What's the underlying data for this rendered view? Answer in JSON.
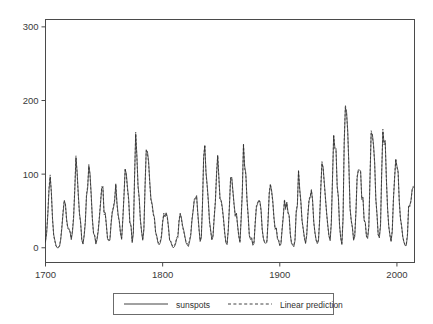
{
  "chart_data": {
    "type": "line",
    "title": "",
    "subtitle": "",
    "xlabel": "",
    "ylabel": "",
    "xlim": [
      1700,
      2015
    ],
    "ylim": [
      -20,
      310
    ],
    "grid": false,
    "legend_position": "bottom",
    "x_ticks": [
      1700,
      1800,
      1900,
      2000
    ],
    "x_tick_labels": [
      "1700",
      "1800",
      "1900",
      "2000"
    ],
    "y_ticks": [
      0,
      100,
      200,
      300
    ],
    "y_tick_labels": [
      "0",
      "100",
      "200",
      "300"
    ],
    "x_start": 1700,
    "x_step": 1,
    "series": [
      {
        "name": "sunspots",
        "style": "solid",
        "values": [
          8,
          20,
          45,
          78,
          96,
          76,
          40,
          18,
          10,
          3,
          0,
          0,
          2,
          11,
          27,
          47,
          63,
          60,
          39,
          28,
          26,
          22,
          11,
          21,
          40,
          78,
          122,
          103,
          73,
          47,
          35,
          11,
          5,
          16,
          34,
          70,
          81,
          111,
          101,
          73,
          40,
          20,
          16,
          5,
          11,
          22,
          40,
          60,
          80.9,
          83.4,
          47.7,
          47.8,
          30.7,
          12.2,
          9.6,
          10.2,
          32.4,
          47.6,
          54,
          62.9,
          85.9,
          61.2,
          45.1,
          36.4,
          20.9,
          11.4,
          37.8,
          69.8,
          106.1,
          100.8,
          81.6,
          66.5,
          34.8,
          30.6,
          7,
          19.8,
          92.5,
          154.4,
          125.9,
          84.8,
          68.1,
          38.5,
          22.8,
          10.2,
          24.1,
          82.9,
          132,
          130.9,
          118.1,
          89.9,
          66.6,
          60,
          46.9,
          41,
          21.3,
          16,
          6.4,
          4.1,
          6.8,
          14.5,
          34,
          45,
          43.1,
          47.5,
          42.2,
          28.1,
          10.1,
          8.1,
          2.5,
          0,
          1.4,
          5,
          12.2,
          13.9,
          35.4,
          45.8,
          41.1,
          30.1,
          23.9,
          15.6,
          6.6,
          4,
          1.8,
          8.5,
          16.6,
          36.3,
          49.6,
          64.2,
          67,
          70.9,
          47.8,
          27.5,
          8.5,
          13.2,
          56.9,
          121.5,
          138.3,
          103.2,
          85.7,
          64.6,
          36.7,
          24.2,
          10.7,
          15,
          40.1,
          61.5,
          98.5,
          124.7,
          96.3,
          66.6,
          64.5,
          54.1,
          39,
          20.6,
          6.7,
          4.3,
          22.7,
          54.8,
          93.8,
          95.8,
          77.2,
          59.1,
          44,
          47,
          30.5,
          16.3,
          7.3,
          37.6,
          74,
          139,
          111.2,
          101.6,
          66.2,
          44.7,
          17,
          11.3,
          12.4,
          3.4,
          6,
          32.3,
          54.3,
          59.7,
          63.7,
          63.5,
          52.2,
          25.4,
          13.1,
          6.8,
          6.3,
          7.1,
          35.6,
          73,
          85.1,
          78,
          64,
          41.8,
          26.2,
          26.7,
          12.1,
          9.5,
          2.7,
          5,
          24.4,
          42,
          63.5,
          53.8,
          62,
          48.5,
          43.9,
          18.6,
          5.7,
          3.6,
          1.4,
          9.6,
          47.4,
          57.1,
          103.9,
          80.6,
          63.6,
          37.6,
          26.1,
          14.2,
          5.8,
          16.7,
          44.3,
          63.9,
          69,
          77.8,
          64.9,
          35.7,
          21.2,
          11.1,
          5.7,
          8.7,
          36.1,
          79.7,
          114.4,
          109.6,
          88.8,
          67.8,
          47.5,
          30.6,
          16.3,
          9.6,
          33.2,
          92.6,
          151.6,
          136.3,
          134.7,
          83.9,
          69.4,
          31.5,
          13.9,
          4.4,
          38,
          141.7,
          190.2,
          184.8,
          159,
          112.3,
          53.9,
          37.5,
          27.9,
          10.2,
          15.1,
          47,
          93.8,
          105.9,
          105.5,
          104.5,
          66.6,
          68.9,
          38,
          34.5,
          15.5,
          12.6,
          27.5,
          92.5,
          155.4,
          154.6,
          140.4,
          115.9,
          66.6,
          45.9,
          17.9,
          13.4,
          29.4,
          100.2,
          157.6,
          142.6,
          145.7,
          94.3,
          54.6,
          29.9,
          17.5,
          8.6,
          21.5,
          64.3,
          93.3,
          119.6,
          111,
          104,
          63.7,
          40.4,
          29.8,
          15.2,
          7.5,
          2.9,
          3.1,
          16.5,
          55.3,
          57.9,
          64.4,
          79.5,
          81.9
        ]
      },
      {
        "name": "Linear prediction",
        "style": "dashed",
        "values": [
          10,
          22,
          48,
          82,
          99,
          74,
          38,
          16,
          9,
          2,
          1,
          1,
          3,
          13,
          30,
          50,
          65,
          58,
          37,
          26,
          25,
          21,
          13,
          24,
          44,
          82,
          125,
          100,
          70,
          45,
          33,
          10,
          6,
          18,
          37,
          73,
          84,
          113,
          98,
          70,
          38,
          19,
          17,
          7,
          13,
          25,
          43,
          63,
          83,
          81,
          45,
          46,
          29,
          11,
          11,
          12,
          35,
          50,
          56,
          65,
          87,
          59,
          43,
          35,
          19,
          13,
          40,
          72,
          108,
          98,
          79,
          64,
          33,
          29,
          9,
          22,
          96,
          157,
          123,
          82,
          66,
          37,
          21,
          12,
          27,
          86,
          134,
          128,
          115,
          87,
          64,
          58,
          45,
          39,
          20,
          15,
          8,
          6,
          9,
          17,
          36,
          47,
          42,
          46,
          40,
          26,
          9,
          9,
          4,
          2,
          3,
          7,
          14,
          16,
          38,
          47,
          39,
          28,
          22,
          14,
          8,
          6,
          4,
          11,
          19,
          39,
          51,
          66,
          68,
          69,
          45,
          25,
          10,
          16,
          60,
          124,
          140,
          100,
          83,
          62,
          34,
          22,
          12,
          17,
          43,
          64,
          101,
          126,
          94,
          64,
          63,
          52,
          37,
          19,
          8,
          6,
          25,
          58,
          96,
          93,
          75,
          57,
          42,
          46,
          29,
          15,
          9,
          41,
          78,
          142,
          108,
          99,
          64,
          42,
          16,
          13,
          14,
          5,
          8,
          35,
          57,
          61,
          65,
          62,
          50,
          24,
          12,
          8,
          8,
          9,
          39,
          76,
          87,
          76,
          62,
          40,
          25,
          28,
          14,
          11,
          4,
          7,
          27,
          45,
          66,
          52,
          60,
          47,
          42,
          17,
          7,
          5,
          3,
          12,
          51,
          59,
          106,
          78,
          61,
          36,
          25,
          13,
          7,
          19,
          47,
          66,
          70,
          79,
          63,
          34,
          20,
          10,
          7,
          11,
          39,
          83,
          117,
          107,
          86,
          66,
          46,
          29,
          15,
          12,
          36,
          96,
          154,
          134,
          132,
          82,
          68,
          30,
          13,
          6,
          41,
          146,
          194,
          182,
          156,
          110,
          52,
          36,
          27,
          12,
          18,
          50,
          97,
          104,
          103,
          103,
          65,
          67,
          37,
          33,
          15,
          15,
          30,
          96,
          159,
          152,
          138,
          114,
          65,
          44,
          17,
          16,
          32,
          104,
          161,
          140,
          143,
          92,
          53,
          29,
          17,
          10,
          24,
          67,
          96,
          121,
          109,
          102,
          62,
          39,
          29,
          14,
          8,
          4,
          5,
          19,
          58,
          56,
          63,
          78,
          84
        ]
      }
    ]
  },
  "plot": {
    "frame_color": "#4a4a4a",
    "line_color": "#2e2e2e",
    "background": "#ffffff"
  },
  "legend": {
    "entries": [
      {
        "label": "sunspots",
        "style": "solid"
      },
      {
        "label": "Linear prediction",
        "style": "dashed"
      }
    ]
  }
}
